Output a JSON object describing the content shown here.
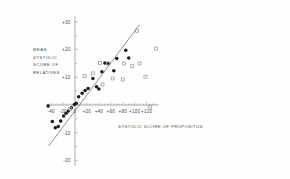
{
  "chart_data": {
    "type": "scatter",
    "title": "",
    "xlabel": "SYSTOLIC SCORE OF PROPOSITUS",
    "ylabel_lines": [
      "MEAN",
      "SYSTOLIC",
      "SCORE OF",
      "RELATIVES"
    ],
    "ylabel": "MEAN SYSTOLIC SCORE OF RELATIVES",
    "xlim": [
      -48,
      140
    ],
    "ylim": [
      -22,
      32
    ],
    "xticks": [
      -40,
      -20,
      0,
      20,
      40,
      60,
      80,
      100,
      120
    ],
    "xticklabels": [
      "-40",
      "-20",
      "0",
      "+20",
      "+40",
      "+60",
      "+80",
      "+100",
      "+120"
    ],
    "yticks": [
      -20,
      -10,
      0,
      10,
      20,
      30
    ],
    "yticklabels": [
      "-20",
      "-10",
      "0",
      "+10",
      "+20",
      "+30"
    ],
    "minor_tick_step": 5,
    "grid": false,
    "legend": null,
    "axis_color": "#8a8a8a",
    "series": [
      {
        "name": "filled",
        "marker": "filled-circle",
        "color": "#1a1a1a",
        "points": [
          [
            -45,
            -0.4
          ],
          [
            -38,
            -6.0
          ],
          [
            -33,
            -8.2
          ],
          [
            -28,
            -7.8
          ],
          [
            -24,
            -5.8
          ],
          [
            -19,
            -4.0
          ],
          [
            -15,
            -3.0
          ],
          [
            -11,
            -2.2
          ],
          [
            -6,
            -1.0
          ],
          [
            -1,
            0.2
          ],
          [
            2,
            0.6
          ],
          [
            6,
            3.0
          ],
          [
            12,
            4.2
          ],
          [
            17,
            5.2
          ],
          [
            22,
            6.0
          ],
          [
            30,
            9.6
          ],
          [
            36,
            6.6
          ],
          [
            40,
            5.8
          ],
          [
            45,
            12.0
          ],
          [
            50,
            15.2
          ],
          [
            56,
            15.0
          ],
          [
            65,
            12.4
          ],
          [
            70,
            16.8
          ],
          [
            90,
            17.0
          ],
          [
            85,
            19.8
          ]
        ]
      },
      {
        "name": "open",
        "marker": "open-square",
        "color": "#9a9a9a",
        "points": [
          [
            -8,
            -1.4
          ],
          [
            16,
            10.4
          ],
          [
            30,
            11.4
          ],
          [
            42,
            15.2
          ],
          [
            46,
            7.4
          ],
          [
            55,
            15.0
          ],
          [
            63,
            9.6
          ],
          [
            80,
            9.2
          ],
          [
            82,
            15.0
          ],
          [
            96,
            14.0
          ],
          [
            108,
            15.0
          ],
          [
            118,
            10.2
          ],
          [
            126,
            -0.6
          ],
          [
            136,
            20.4
          ],
          [
            104,
            26.8
          ]
        ]
      }
    ],
    "regression_line": {
      "name": "fitted-line",
      "color": "#7a7a7a",
      "x_start": -44,
      "y_start": -14.8,
      "x_end": 108,
      "y_end": 29.0
    }
  }
}
